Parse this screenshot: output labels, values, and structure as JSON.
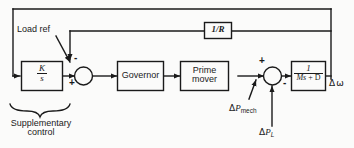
{
  "figure": {
    "kind": "control-block-diagram",
    "ink_color": "#1a1a1a",
    "paper_color": "#fbfbfa"
  },
  "blocks": {
    "integrator": {
      "numerator": "K",
      "denominator": "s"
    },
    "governor": {
      "label": "Governor"
    },
    "prime_mover": {
      "line1": "Prime",
      "line2": "mover"
    },
    "droop": {
      "label": "1/R"
    },
    "machine": {
      "numerator": "1",
      "denominator_lead": "Ms",
      "denominator_tail": " + D"
    }
  },
  "labels": {
    "load_ref": "Load ref",
    "supplementary_line1": "Supplementary",
    "supplementary_line2": "control",
    "delta_p_mech_delta": "Δ",
    "delta_p_mech_p": "P",
    "delta_p_mech_sub": "mech",
    "delta_p_l_delta": "Δ",
    "delta_p_l_p": "P",
    "delta_p_l_sub": "L",
    "delta_omega_delta": "Δ",
    "delta_omega_w": "ω"
  },
  "signs": {
    "sum1_plus": "+",
    "sum1_minus": "-",
    "sum2_plus": "+",
    "sum2_minus": "-"
  }
}
